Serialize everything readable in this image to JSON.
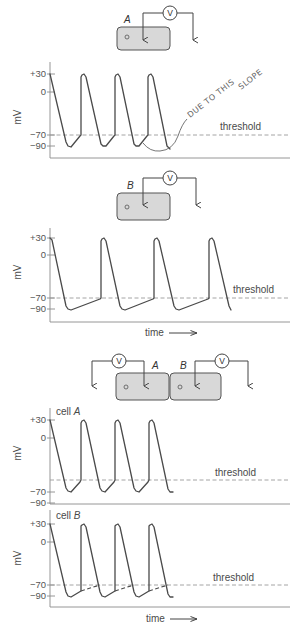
{
  "voltmeter_symbol": "V",
  "y_axis_unit": "mV",
  "threshold_label": "threshold",
  "time_label": "time",
  "panels": {
    "p1": {
      "cell_label": "A",
      "ticks": [
        "+30",
        "0",
        "−70",
        "−90"
      ],
      "annotation": {
        "line1": "DUE TO THIS",
        "line2": "SLOPE"
      },
      "trace_points": [
        [
          50,
          74
        ],
        [
          66,
          142
        ],
        [
          68,
          146
        ],
        [
          71,
          147
        ],
        [
          80,
          136
        ],
        [
          81,
          135
        ],
        [
          81,
          77
        ],
        [
          82,
          75
        ],
        [
          84,
          74
        ],
        [
          86,
          77
        ],
        [
          101,
          144
        ],
        [
          103,
          146
        ],
        [
          106,
          146
        ],
        [
          114,
          136
        ],
        [
          115,
          135
        ],
        [
          115,
          77
        ],
        [
          116,
          75
        ],
        [
          118,
          74
        ],
        [
          120,
          77
        ],
        [
          134,
          144
        ],
        [
          136,
          146
        ],
        [
          139,
          146
        ],
        [
          147,
          136
        ],
        [
          148,
          135
        ],
        [
          148,
          77
        ],
        [
          149,
          75
        ],
        [
          151,
          74
        ],
        [
          153,
          77
        ],
        [
          167,
          146
        ],
        [
          170,
          149
        ]
      ]
    },
    "p2": {
      "cell_label": "B",
      "ticks": [
        "+30",
        "0",
        "−70",
        "−90"
      ],
      "trace_points": [
        [
          50,
          238
        ],
        [
          52,
          240
        ],
        [
          66,
          306
        ],
        [
          68,
          309
        ],
        [
          71,
          310
        ],
        [
          100,
          299
        ],
        [
          101,
          298
        ],
        [
          101,
          241
        ],
        [
          102,
          239
        ],
        [
          104,
          238
        ],
        [
          106,
          241
        ],
        [
          120,
          306
        ],
        [
          122,
          309
        ],
        [
          125,
          310
        ],
        [
          153,
          299
        ],
        [
          154,
          298
        ],
        [
          154,
          241
        ],
        [
          155,
          239
        ],
        [
          157,
          238
        ],
        [
          159,
          241
        ],
        [
          174,
          306
        ],
        [
          176,
          309
        ],
        [
          179,
          310
        ],
        [
          208,
          299
        ],
        [
          209,
          298
        ],
        [
          209,
          241
        ],
        [
          210,
          239
        ],
        [
          212,
          238
        ],
        [
          214,
          241
        ],
        [
          229,
          306
        ],
        [
          231,
          310
        ]
      ]
    },
    "coupled": {
      "cell_a_label": "A",
      "cell_b_label": "B"
    },
    "p3": {
      "trace_label_prefix": "cell",
      "trace_label_cell": "A",
      "ticks": [
        "+30",
        "0",
        "−70",
        "−90"
      ],
      "trace_points": [
        [
          50,
          420
        ],
        [
          66,
          488
        ],
        [
          68,
          491
        ],
        [
          71,
          492
        ],
        [
          80,
          482
        ],
        [
          81,
          480
        ],
        [
          81,
          423
        ],
        [
          82,
          421
        ],
        [
          84,
          420
        ],
        [
          86,
          423
        ],
        [
          100,
          488
        ],
        [
          102,
          491
        ],
        [
          105,
          492
        ],
        [
          114,
          482
        ],
        [
          115,
          480
        ],
        [
          115,
          423
        ],
        [
          116,
          421
        ],
        [
          118,
          420
        ],
        [
          120,
          423
        ],
        [
          134,
          488
        ],
        [
          136,
          491
        ],
        [
          139,
          492
        ],
        [
          148,
          482
        ],
        [
          149,
          480
        ],
        [
          149,
          423
        ],
        [
          150,
          421
        ],
        [
          152,
          420
        ],
        [
          154,
          423
        ],
        [
          168,
          489
        ],
        [
          170,
          492
        ],
        [
          173,
          492
        ]
      ]
    },
    "p4": {
      "trace_label_prefix": "cell",
      "trace_label_cell": "B",
      "ticks": [
        "+30",
        "0",
        "−70",
        "−90"
      ],
      "trace_points": [
        [
          50,
          524
        ],
        [
          66,
          592
        ],
        [
          68,
          596
        ],
        [
          71,
          597
        ],
        [
          81,
          591
        ],
        [
          81,
          526
        ],
        [
          82,
          525
        ],
        [
          84,
          524
        ],
        [
          86,
          527
        ],
        [
          100,
          592
        ],
        [
          102,
          596
        ],
        [
          105,
          597
        ],
        [
          115,
          591
        ],
        [
          115,
          526
        ],
        [
          116,
          525
        ],
        [
          118,
          524
        ],
        [
          120,
          527
        ],
        [
          134,
          592
        ],
        [
          136,
          596
        ],
        [
          139,
          597
        ],
        [
          149,
          591
        ],
        [
          149,
          526
        ],
        [
          150,
          525
        ],
        [
          152,
          524
        ],
        [
          154,
          527
        ],
        [
          168,
          594
        ],
        [
          170,
          597
        ],
        [
          173,
          597
        ]
      ],
      "dashed_extensions": [
        [
          [
            81,
            591
          ],
          [
            100,
            585
          ]
        ],
        [
          [
            115,
            591
          ],
          [
            134,
            585
          ]
        ],
        [
          [
            149,
            591
          ],
          [
            168,
            585
          ]
        ]
      ]
    }
  }
}
